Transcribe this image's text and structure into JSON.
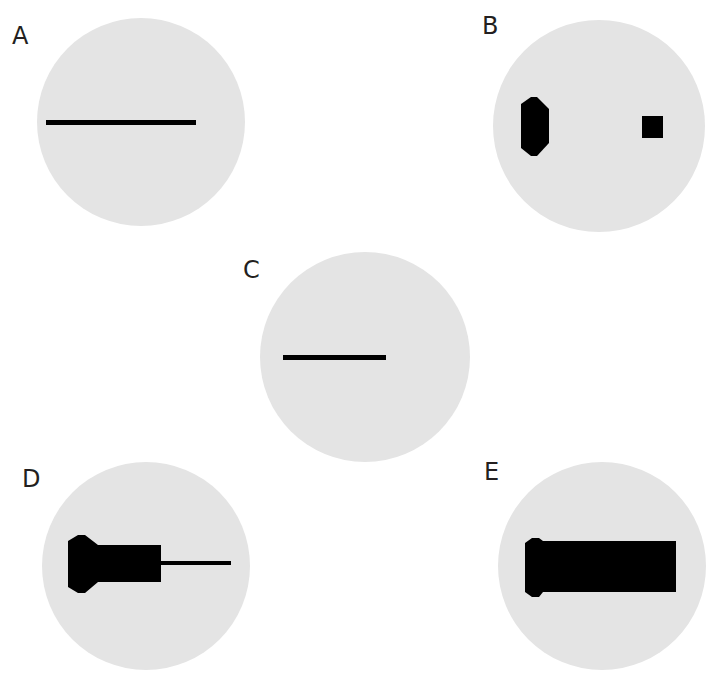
{
  "figure": {
    "background": "#ffffff",
    "disc_color": "#e4e4e4",
    "shape_color": "#000000",
    "panels": [
      {
        "id": "A",
        "label": "A",
        "description": "long thin horizontal line"
      },
      {
        "id": "B",
        "label": "B",
        "description": "elongated hexagonal blob (left) and small square (right)"
      },
      {
        "id": "C",
        "label": "C",
        "description": "short thin horizontal line"
      },
      {
        "id": "D",
        "label": "D",
        "description": "hexagonal head, thick rectangle body, thin tail line"
      },
      {
        "id": "E",
        "label": "E",
        "description": "rounded head with long thick rectangle"
      }
    ]
  }
}
